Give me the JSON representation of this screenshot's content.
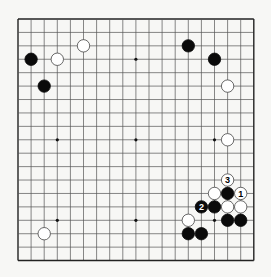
{
  "board": {
    "size": 19,
    "origin_x": 18,
    "origin_y": 19,
    "step_x": 13.1,
    "step_y": 13.42,
    "line_color": "#555555",
    "border_color": "#222222",
    "stone_radius": 6.2,
    "star_points": [
      [
        3,
        3
      ],
      [
        9,
        3
      ],
      [
        15,
        3
      ],
      [
        3,
        9
      ],
      [
        9,
        9
      ],
      [
        15,
        9
      ],
      [
        3,
        15
      ],
      [
        9,
        15
      ],
      [
        15,
        15
      ]
    ]
  },
  "stones": [
    {
      "color": "black",
      "col": 1,
      "row": 3,
      "label": ""
    },
    {
      "color": "white",
      "col": 3,
      "row": 3,
      "label": ""
    },
    {
      "color": "white",
      "col": 5,
      "row": 2,
      "label": ""
    },
    {
      "color": "black",
      "col": 2,
      "row": 5,
      "label": ""
    },
    {
      "color": "black",
      "col": 13,
      "row": 2,
      "label": ""
    },
    {
      "color": "black",
      "col": 15,
      "row": 3,
      "label": ""
    },
    {
      "color": "white",
      "col": 16,
      "row": 5,
      "label": ""
    },
    {
      "color": "white",
      "col": 16,
      "row": 9,
      "label": ""
    },
    {
      "color": "white",
      "col": 2,
      "row": 16,
      "label": ""
    },
    {
      "color": "white",
      "col": 16,
      "row": 12,
      "label": "3"
    },
    {
      "color": "white",
      "col": 15,
      "row": 13,
      "label": ""
    },
    {
      "color": "black",
      "col": 16,
      "row": 13,
      "label": ""
    },
    {
      "color": "white",
      "col": 17,
      "row": 13,
      "label": "1"
    },
    {
      "color": "black",
      "col": 14,
      "row": 14,
      "label": "2"
    },
    {
      "color": "black",
      "col": 15,
      "row": 14,
      "label": ""
    },
    {
      "color": "white",
      "col": 16,
      "row": 14,
      "label": ""
    },
    {
      "color": "white",
      "col": 17,
      "row": 14,
      "label": ""
    },
    {
      "color": "white",
      "col": 13,
      "row": 15,
      "label": ""
    },
    {
      "color": "black",
      "col": 16,
      "row": 15,
      "label": ""
    },
    {
      "color": "black",
      "col": 17,
      "row": 15,
      "label": ""
    },
    {
      "color": "black",
      "col": 13,
      "row": 16,
      "label": ""
    },
    {
      "color": "black",
      "col": 14,
      "row": 16,
      "label": ""
    }
  ]
}
